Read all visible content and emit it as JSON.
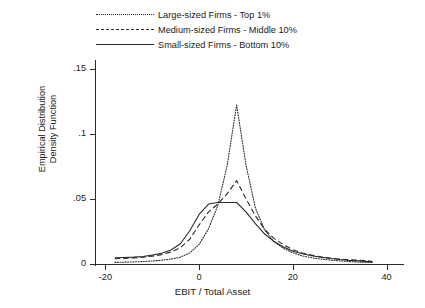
{
  "chart_data": {
    "type": "line",
    "title": "",
    "subtitle": "",
    "xlabel": "EBIT / Total Asset",
    "ylabel_line1": "Empirical Distribution",
    "ylabel_line2": "Density Function",
    "xlim": [
      -22,
      42
    ],
    "ylim": [
      0,
      0.155
    ],
    "grid": false,
    "legend_position": "top-center",
    "xticks": [
      -20,
      0,
      20,
      40
    ],
    "xtick_labels": [
      "-20",
      "0",
      "20",
      "40"
    ],
    "yticks": [
      0,
      0.05,
      0.1,
      0.15
    ],
    "ytick_labels": [
      "0",
      ".05",
      ".1",
      ".15"
    ],
    "series": [
      {
        "name": "Large-sized Firms - Top 1%",
        "style": "dotted",
        "color": "#2b2b2b",
        "x": [
          -18,
          -16,
          -14,
          -12,
          -10,
          -8,
          -6,
          -4,
          -2,
          0,
          2,
          4,
          6,
          8,
          10,
          12,
          14,
          16,
          18,
          20,
          22,
          24,
          26,
          28,
          30,
          32,
          34,
          36,
          37
        ],
        "y": [
          0.0012,
          0.0014,
          0.0016,
          0.0019,
          0.0023,
          0.0029,
          0.0038,
          0.0052,
          0.0085,
          0.015,
          0.027,
          0.045,
          0.076,
          0.122,
          0.076,
          0.043,
          0.026,
          0.017,
          0.012,
          0.0085,
          0.0062,
          0.0048,
          0.0038,
          0.003,
          0.0024,
          0.0019,
          0.0015,
          0.0012,
          0.0011
        ]
      },
      {
        "name": "Medium-sized Firms - Middle 10%",
        "style": "dashed",
        "color": "#2b2b2b",
        "x": [
          -18,
          -16,
          -14,
          -12,
          -10,
          -8,
          -6,
          -4,
          -2,
          0,
          2,
          4,
          6,
          8,
          10,
          12,
          14,
          16,
          18,
          20,
          22,
          24,
          26,
          28,
          30,
          32,
          34,
          36,
          37
        ],
        "y": [
          0.004,
          0.0043,
          0.0047,
          0.0052,
          0.006,
          0.0072,
          0.0092,
          0.0125,
          0.019,
          0.03,
          0.04,
          0.046,
          0.054,
          0.064,
          0.05,
          0.037,
          0.0265,
          0.0195,
          0.0148,
          0.011,
          0.0085,
          0.0068,
          0.0055,
          0.0045,
          0.0038,
          0.0032,
          0.003,
          0.0024,
          0.0018
        ]
      },
      {
        "name": "Small-sized Firms - Bottom 10%",
        "style": "solid",
        "color": "#2b2b2b",
        "x": [
          -18,
          -16,
          -14,
          -12,
          -10,
          -8,
          -6,
          -4,
          -2,
          0,
          2,
          4,
          6,
          8,
          10,
          12,
          14,
          16,
          18,
          20,
          22,
          24,
          26,
          28,
          30,
          32,
          34,
          36,
          37
        ],
        "y": [
          0.0048,
          0.005,
          0.0053,
          0.0058,
          0.0068,
          0.0082,
          0.0108,
          0.0155,
          0.0255,
          0.038,
          0.046,
          0.0472,
          0.0472,
          0.0472,
          0.04,
          0.031,
          0.023,
          0.0172,
          0.013,
          0.0098,
          0.0078,
          0.0063,
          0.0052,
          0.0042,
          0.0034,
          0.0028,
          0.0024,
          0.0018,
          0.0014
        ]
      }
    ]
  },
  "legend": {
    "items": [
      {
        "label": "Large-sized Firms - Top 1%",
        "style": "dotted"
      },
      {
        "label": "Medium-sized Firms - Middle 10%",
        "style": "dashed"
      },
      {
        "label": "Small-sized Firms - Bottom 10%",
        "style": "solid"
      }
    ]
  }
}
